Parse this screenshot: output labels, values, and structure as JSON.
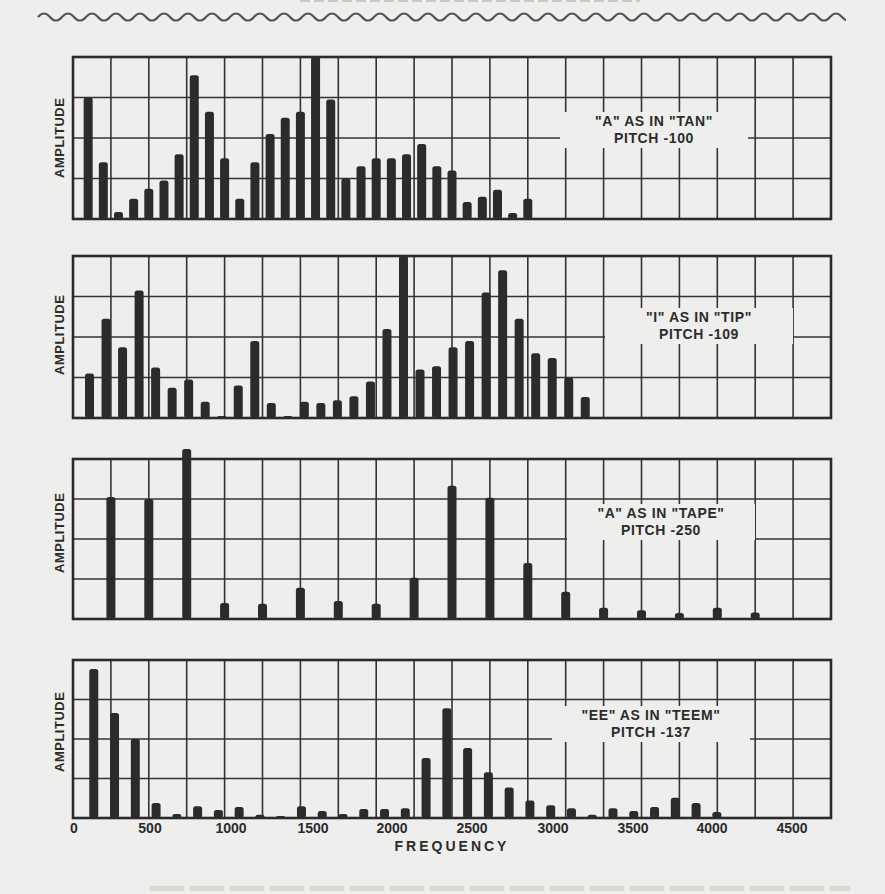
{
  "figure": {
    "heading_clipped": "",
    "x_axis_label": "FREQUENCY",
    "x_ticks": [
      "0",
      "500",
      "1000",
      "1500",
      "2000",
      "2500",
      "3000",
      "3500",
      "4000",
      "4500"
    ],
    "y_axis_label": "AMPLITUDE"
  },
  "panels": [
    {
      "caption_line1": "\"A\" AS IN \"TAN\"",
      "caption_line2": "PITCH -100",
      "y_label": "AMPLITUDE"
    },
    {
      "caption_line1": "\"I\" AS IN \"TIP\"",
      "caption_line2": "PITCH -109",
      "y_label": "AMPLITUDE"
    },
    {
      "caption_line1": "\"A\" AS IN \"TAPE\"",
      "caption_line2": "PITCH -250",
      "y_label": "AMPLITUDE"
    },
    {
      "caption_line1": "\"EE\" AS IN \"TEEM\"",
      "caption_line2": "PITCH -137",
      "y_label": "AMPLITUDE"
    }
  ],
  "colors": {
    "ink": "#2b2b2b",
    "paper": "#eeeeec",
    "grid": "#333333"
  },
  "chart_data": [
    {
      "type": "bar",
      "title": "\"A\" AS IN \"TAN\" PITCH - 100",
      "xlabel": "FREQUENCY",
      "ylabel": "AMPLITUDE",
      "xlim": [
        0,
        5000
      ],
      "ylim": [
        0,
        4
      ],
      "grid": {
        "x_step": 250,
        "y_divisions": 4
      },
      "pitch": 100,
      "x": [
        100,
        200,
        300,
        400,
        500,
        600,
        700,
        800,
        900,
        1000,
        1100,
        1200,
        1300,
        1400,
        1500,
        1600,
        1700,
        1800,
        1900,
        2000,
        2100,
        2200,
        2300,
        2400,
        2500,
        2600,
        2700,
        2800,
        2900,
        3000
      ],
      "values": [
        3.0,
        1.4,
        0.17,
        0.5,
        0.75,
        0.95,
        1.6,
        3.55,
        2.65,
        1.5,
        0.5,
        1.4,
        2.1,
        2.5,
        2.65,
        4.0,
        2.95,
        1.0,
        1.3,
        1.5,
        1.5,
        1.6,
        1.85,
        1.3,
        1.2,
        0.42,
        0.55,
        0.72,
        0.15,
        0.5
      ]
    },
    {
      "type": "bar",
      "title": "\"I\" AS IN \"TIP\" PITCH - 109",
      "xlabel": "FREQUENCY",
      "ylabel": "AMPLITUDE",
      "xlim": [
        0,
        5000
      ],
      "ylim": [
        0,
        4
      ],
      "grid": {
        "x_step": 250,
        "y_divisions": 4
      },
      "pitch": 109,
      "x": [
        109,
        218,
        327,
        436,
        545,
        654,
        763,
        872,
        981,
        1090,
        1199,
        1308,
        1417,
        1526,
        1635,
        1744,
        1853,
        1962,
        2071,
        2180,
        2289,
        2398,
        2507,
        2616,
        2725,
        2834,
        2943,
        3052,
        3161,
        3270,
        3379
      ],
      "values": [
        1.1,
        2.45,
        1.75,
        3.15,
        1.25,
        0.75,
        0.95,
        0.4,
        0.03,
        0.8,
        1.9,
        0.37,
        0.02,
        0.4,
        0.37,
        0.44,
        0.54,
        0.9,
        2.2,
        4.0,
        1.2,
        1.28,
        1.75,
        1.9,
        3.1,
        3.65,
        2.45,
        1.6,
        1.48,
        1.0,
        0.52
      ]
    },
    {
      "type": "bar",
      "title": "\"A\" AS IN \"TAPE\" PITCH - 250",
      "xlabel": "FREQUENCY",
      "ylabel": "AMPLITUDE",
      "xlim": [
        0,
        5000
      ],
      "ylim": [
        0,
        4
      ],
      "grid": {
        "x_step": 250,
        "y_divisions": 4
      },
      "pitch": 250,
      "x": [
        250,
        500,
        750,
        1000,
        1250,
        1500,
        1750,
        2000,
        2250,
        2500,
        2750,
        3000,
        3250,
        3500,
        3750,
        4000,
        4250,
        4500
      ],
      "values": [
        3.05,
        3.0,
        4.25,
        0.4,
        0.38,
        0.78,
        0.45,
        0.38,
        1.03,
        3.33,
        3.03,
        1.4,
        0.68,
        0.28,
        0.22,
        0.15,
        0.28,
        0.16
      ]
    },
    {
      "type": "bar",
      "title": "\"EE\" AS IN \"TEEM\" PITCH - 137",
      "xlabel": "FREQUENCY",
      "ylabel": "AMPLITUDE",
      "xlim": [
        0,
        5000
      ],
      "ylim": [
        0,
        4
      ],
      "grid": {
        "x_step": 250,
        "y_divisions": 4
      },
      "x_tick_labels": [
        "0",
        "500",
        "1000",
        "1500",
        "2000",
        "2500",
        "3000",
        "3500",
        "4000",
        "4500"
      ],
      "pitch": 137,
      "x": [
        137,
        274,
        411,
        548,
        685,
        822,
        959,
        1096,
        1233,
        1370,
        1507,
        1644,
        1781,
        1918,
        2055,
        2192,
        2329,
        2466,
        2603,
        2740,
        2877,
        3014,
        3151,
        3288,
        3425,
        3562,
        3699,
        3836,
        3973,
        4110,
        4247
      ],
      "values": [
        3.77,
        2.66,
        2.0,
        0.38,
        0.1,
        0.3,
        0.2,
        0.28,
        0.08,
        0.05,
        0.3,
        0.18,
        0.1,
        0.23,
        0.23,
        0.25,
        1.52,
        2.78,
        1.77,
        1.16,
        0.77,
        0.44,
        0.32,
        0.25,
        0.08,
        0.25,
        0.18,
        0.28,
        0.51,
        0.38,
        0.15
      ]
    }
  ]
}
